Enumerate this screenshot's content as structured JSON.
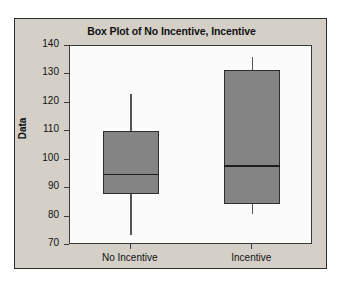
{
  "chart_data": {
    "type": "box",
    "title": "Box Plot of No Incentive, Incentive",
    "xlabel": "",
    "ylabel": "Data",
    "categories": [
      "No Incentive",
      "Incentive"
    ],
    "ylim": [
      70,
      140
    ],
    "yticks": [
      70,
      80,
      90,
      100,
      110,
      120,
      130,
      140
    ],
    "grid": false,
    "legend": null,
    "boxes": [
      {
        "name": "No Incentive",
        "min": 73.5,
        "q1": 88,
        "median": 95,
        "q3": 110,
        "max": 123
      },
      {
        "name": "Incentive",
        "min": 81,
        "q1": 84.5,
        "median": 98,
        "q3": 131.5,
        "max": 136
      }
    ],
    "colors": {
      "box_fill": "#848484",
      "box_edge": "#2e2e2e",
      "median": "#1d1d1d",
      "whisker": "#555555",
      "figure_background": "#d4d0c8",
      "plot_background": "#fbfbfb",
      "axis": "#3a3a3a",
      "text": "#101010"
    }
  }
}
